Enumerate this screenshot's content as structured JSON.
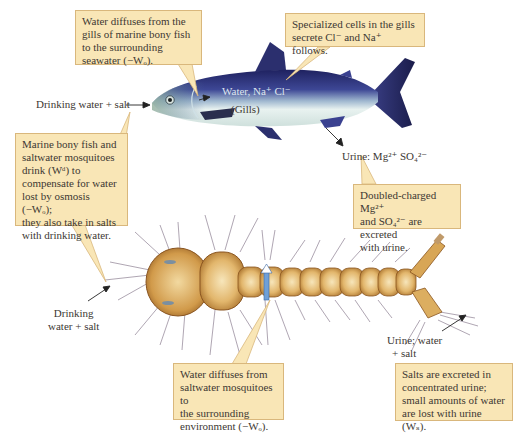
{
  "figure": {
    "subjects": [
      "marine bony fish",
      "saltwater mosquito larva"
    ]
  },
  "callouts": {
    "fish_gill_diffusion": {
      "lines": [
        "Water diffuses from the",
        "gills of marine bony fish",
        "to the surrounding",
        "seawater (−Wₒ)."
      ]
    },
    "gill_cells": {
      "lines": [
        "Specialized cells in the gills",
        "secrete Cl⁻ and Na⁺ follows."
      ]
    },
    "drink_compensate": {
      "lines": [
        "Marine bony fish and",
        "saltwater mosquitoes",
        "drink (Wᵈ) to",
        "compensate for water",
        "lost by osmosis (−Wₒ);",
        "they also take in salts",
        "with drinking water."
      ]
    },
    "doubled_charged": {
      "lines": [
        "Doubled-charged Mg²⁺",
        "and SO₄²⁻ are excreted",
        "with urine."
      ]
    },
    "mosquito_diffusion": {
      "lines": [
        "Water diffuses from",
        "saltwater mosquitoes to",
        "the surrounding",
        "environment (−Wₒ)."
      ]
    },
    "salts_excreted": {
      "lines": [
        "Salts are excreted in",
        "concentrated urine;",
        "small amounts of water",
        "are lost with urine (Wₛ)."
      ]
    }
  },
  "labels": {
    "fish_drinking": "Drinking water + salt",
    "fish_water_ions": "Water, Na⁺ Cl⁻",
    "fish_gills": "(Gills)",
    "fish_urine": "Urine: Mg²⁺ SO₄²⁻",
    "mosquito_drinking_1": "Drinking",
    "mosquito_drinking_2": "water + salt",
    "mosquito_urine_1": "Urine; water",
    "mosquito_urine_2": "+ salt"
  },
  "colors": {
    "callout_fill": "#f9e6b6",
    "callout_border": "#d9b77c",
    "fish_dorsal": "#2b2f6e",
    "fish_belly": "#eaf3f2",
    "larva_body": "#c98f3e",
    "larva_light": "#f3dfae",
    "arrow_blue": "#6fa0d8"
  }
}
